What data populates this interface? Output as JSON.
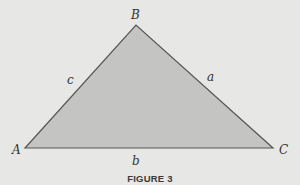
{
  "figure": {
    "caption": "FIGURE 3",
    "background_color": "#e7e7e5",
    "fill_color": "#c4c4c2",
    "stroke_color": "#555555"
  },
  "triangle": {
    "vertices": {
      "A": {
        "label": "A",
        "x": 25,
        "y": 148
      },
      "B": {
        "label": "B",
        "x": 136,
        "y": 25
      },
      "C": {
        "label": "C",
        "x": 273,
        "y": 148
      }
    },
    "sides": {
      "a": {
        "label": "a",
        "between": [
          "B",
          "C"
        ]
      },
      "b": {
        "label": "b",
        "between": [
          "A",
          "C"
        ]
      },
      "c": {
        "label": "c",
        "between": [
          "A",
          "B"
        ]
      }
    }
  }
}
